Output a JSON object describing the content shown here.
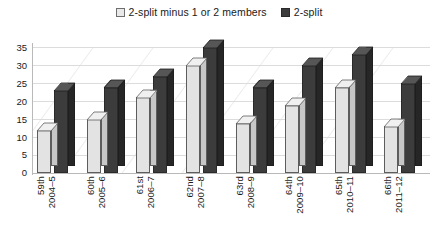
{
  "legend": {
    "position": "top-center",
    "entries": [
      {
        "label": "2-split minus 1 or 2 members",
        "swatch_name": "legend-swatch-light",
        "color": "#e3e3e3"
      },
      {
        "label": "2-split",
        "swatch_name": "legend-swatch-dark",
        "color": "#3c3c3c"
      }
    ]
  },
  "axes": {
    "y_ticks": [
      "35",
      "30",
      "25",
      "20",
      "15",
      "10",
      "5",
      "0"
    ],
    "x_labels": [
      {
        "line1": "59th",
        "line2": "2004–5"
      },
      {
        "line1": "60th",
        "line2": "2005–6"
      },
      {
        "line1": "61st",
        "line2": "2006–7"
      },
      {
        "line1": "62nd",
        "line2": "2007–8"
      },
      {
        "line1": "63rd",
        "line2": "2008–9"
      },
      {
        "line1": "64th",
        "line2": "2009–10"
      },
      {
        "line1": "65th",
        "line2": "2010–11"
      },
      {
        "line1": "66th",
        "line2": "2011–12"
      }
    ]
  },
  "chart_data": {
    "type": "bar",
    "title": "",
    "subtitle": "",
    "xlabel": "",
    "ylabel": "",
    "ylim": [
      0,
      35
    ],
    "ytick_step": 5,
    "grid": true,
    "three_d": true,
    "legend_position": "top-center",
    "categories": [
      "59th 2004–5",
      "60th 2005–6",
      "61st 2006–7",
      "62nd 2007–8",
      "63rd 2008–9",
      "64th 2009–10",
      "65th 2010–11",
      "66th 2011–12"
    ],
    "series": [
      {
        "name": "2-split minus 1 or 2 members",
        "color": "#e3e3e3",
        "values": [
          12,
          15,
          21,
          30,
          14,
          19,
          24,
          13
        ]
      },
      {
        "name": "2-split",
        "color": "#3c3c3c",
        "values": [
          23,
          24,
          27,
          35,
          24,
          30,
          33,
          25
        ]
      }
    ]
  }
}
